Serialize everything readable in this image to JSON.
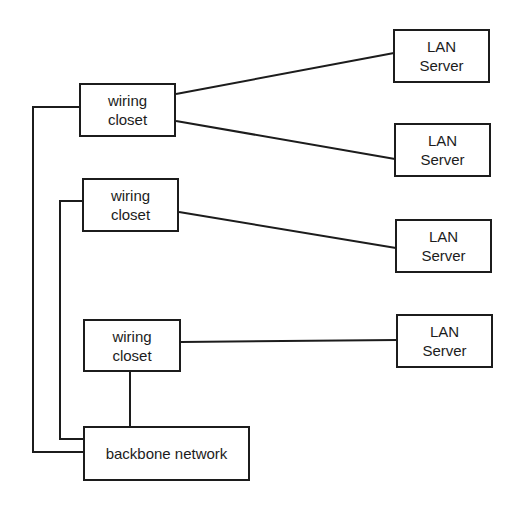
{
  "diagram": {
    "nodes": {
      "closet1": {
        "line1": "wiring",
        "line2": "closet"
      },
      "closet2": {
        "line1": "wiring",
        "line2": "closet"
      },
      "closet3": {
        "line1": "wiring",
        "line2": "closet"
      },
      "server1": {
        "line1": "LAN",
        "line2": "Server"
      },
      "server2": {
        "line1": "LAN",
        "line2": "Server"
      },
      "server3": {
        "line1": "LAN",
        "line2": "Server"
      },
      "server4": {
        "line1": "LAN",
        "line2": "Server"
      },
      "backbone": {
        "label": "backbone network"
      }
    },
    "edges": [
      {
        "from": "closet1",
        "to": "server1"
      },
      {
        "from": "closet1",
        "to": "server2"
      },
      {
        "from": "closet2",
        "to": "server3"
      },
      {
        "from": "closet3",
        "to": "server4"
      },
      {
        "from": "closet1",
        "to": "backbone"
      },
      {
        "from": "closet2",
        "to": "backbone"
      },
      {
        "from": "closet3",
        "to": "backbone"
      }
    ],
    "colors": {
      "stroke": "#1c1c1c",
      "background": "#ffffff"
    }
  }
}
